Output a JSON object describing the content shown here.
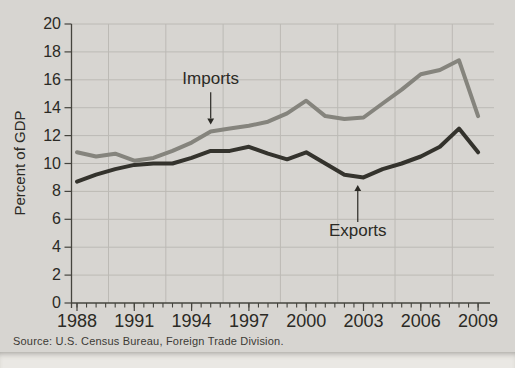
{
  "figure": {
    "source_note": "Source: U.S. Census Bureau, Foreign Trade Division.",
    "colors": {
      "figure_background": "#d7d5d1",
      "page_background": "#eae8e4",
      "grid": "#bcbab5",
      "axis": "#45443e",
      "text": "#2b2a25",
      "imports_line": "#85847d",
      "exports_line": "#34332d",
      "source_text": "#3c3a35"
    }
  },
  "chart_data": {
    "type": "line",
    "title": "",
    "xlabel": "",
    "ylabel": "Percent of GDP",
    "ylim": [
      0,
      20
    ],
    "ytick_step": 2,
    "grid": "both",
    "legend_position": "inline-annotations",
    "x": [
      1988,
      1989,
      1990,
      1991,
      1992,
      1993,
      1994,
      1995,
      1996,
      1997,
      1998,
      1999,
      2000,
      2001,
      2002,
      2003,
      2004,
      2005,
      2006,
      2007,
      2008,
      2009
    ],
    "xtick_labels": [
      "1988",
      "1991",
      "1994",
      "1997",
      "2000",
      "2003",
      "2006",
      "2009"
    ],
    "series": [
      {
        "name": "Imports",
        "color_key": "imports_line",
        "values": [
          10.8,
          10.5,
          10.7,
          10.2,
          10.4,
          10.9,
          11.5,
          12.3,
          12.5,
          12.7,
          13.0,
          13.6,
          14.5,
          13.4,
          13.2,
          13.3,
          14.3,
          15.3,
          16.4,
          16.7,
          17.4,
          13.4
        ]
      },
      {
        "name": "Exports",
        "color_key": "exports_line",
        "values": [
          8.7,
          9.2,
          9.6,
          9.9,
          10.0,
          10.0,
          10.4,
          10.9,
          10.9,
          11.2,
          10.7,
          10.3,
          10.8,
          10.0,
          9.2,
          9.0,
          9.6,
          10.0,
          10.5,
          11.2,
          12.5,
          10.8
        ]
      }
    ],
    "annotations": [
      {
        "text": "Imports",
        "year": 1995,
        "text_y": 16.1,
        "arrow_from_y": 15.1,
        "arrow_tip_y": 12.8,
        "dir": "down"
      },
      {
        "text": "Exports",
        "year": 2002.7,
        "text_y": 5.25,
        "arrow_from_y": 5.8,
        "arrow_tip_y": 8.45,
        "dir": "up"
      }
    ]
  }
}
